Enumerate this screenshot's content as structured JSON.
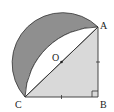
{
  "diagram": {
    "type": "geometry",
    "points": {
      "A": {
        "label": "A",
        "x": 98,
        "y": 27
      },
      "B": {
        "label": "B",
        "x": 98,
        "y": 97
      },
      "C": {
        "label": "C",
        "x": 25,
        "y": 97
      },
      "O": {
        "label": "O",
        "x": 61.5,
        "y": 62
      }
    },
    "labels": {
      "A": "A",
      "B": "B",
      "C": "C",
      "O": "O"
    },
    "marks": {
      "equal_sides": [
        "AB",
        "BC"
      ],
      "right_angle": "B"
    },
    "colors": {
      "shaded_dark": "#8f8f8f",
      "triangle_fill": "#d9d9d9",
      "stroke": "#333333",
      "background": "#ffffff"
    }
  }
}
